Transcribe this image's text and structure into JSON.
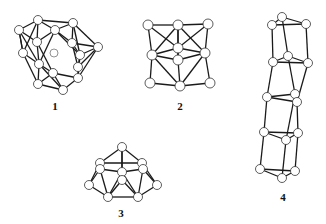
{
  "figure": {
    "background": "#ffffff",
    "line_color": "#1a1a1a",
    "atom_fill": "#ffffff",
    "atom_stroke": "#333333"
  },
  "structures": [
    {
      "id": "1",
      "label": "1",
      "label_pos": [
        55,
        106
      ],
      "atom_r": 4.5,
      "atoms": [
        [
          38,
          20
        ],
        [
          73,
          23
        ],
        [
          55,
          30
        ],
        [
          19,
          30
        ],
        [
          37,
          42
        ],
        [
          72,
          43
        ],
        [
          98,
          47
        ],
        [
          23,
          53
        ],
        [
          80,
          55
        ],
        [
          39,
          64
        ],
        [
          78,
          67
        ],
        [
          53,
          73
        ],
        [
          78,
          78
        ],
        [
          38,
          84
        ],
        [
          63,
          90
        ]
      ],
      "inner_atom": [
        54,
        53
      ],
      "bonds": [
        [
          0,
          1
        ],
        [
          0,
          2
        ],
        [
          0,
          3
        ],
        [
          1,
          2
        ],
        [
          1,
          6
        ],
        [
          1,
          5
        ],
        [
          2,
          4
        ],
        [
          2,
          5
        ],
        [
          3,
          4
        ],
        [
          3,
          7
        ],
        [
          0,
          4
        ],
        [
          4,
          9
        ],
        [
          7,
          9
        ],
        [
          7,
          3
        ],
        [
          5,
          6
        ],
        [
          5,
          8
        ],
        [
          6,
          8
        ],
        [
          6,
          10
        ],
        [
          8,
          10
        ],
        [
          8,
          12
        ],
        [
          10,
          12
        ],
        [
          9,
          11
        ],
        [
          11,
          12
        ],
        [
          11,
          14
        ],
        [
          12,
          14
        ],
        [
          9,
          13
        ],
        [
          13,
          14
        ],
        [
          13,
          7
        ],
        [
          2,
          9
        ],
        [
          4,
          11
        ],
        [
          5,
          10
        ],
        [
          2,
          8
        ],
        [
          11,
          13
        ],
        [
          3,
          9
        ],
        [
          1,
          8
        ],
        [
          0,
          7
        ],
        [
          12,
          6
        ],
        [
          9,
          14
        ]
      ]
    },
    {
      "id": "2",
      "label": "2",
      "label_pos": [
        180,
        106
      ],
      "atom_r": 5,
      "atoms": [
        [
          148,
          25
        ],
        [
          178,
          25
        ],
        [
          208,
          24
        ],
        [
          178,
          48
        ],
        [
          152,
          55
        ],
        [
          178,
          60
        ],
        [
          205,
          53
        ],
        [
          150,
          83
        ],
        [
          180,
          86
        ],
        [
          210,
          83
        ]
      ],
      "bonds": [
        [
          0,
          1
        ],
        [
          1,
          2
        ],
        [
          0,
          4
        ],
        [
          2,
          6
        ],
        [
          4,
          7
        ],
        [
          6,
          9
        ],
        [
          1,
          4
        ],
        [
          1,
          6
        ],
        [
          1,
          5
        ],
        [
          4,
          5
        ],
        [
          5,
          6
        ],
        [
          4,
          8
        ],
        [
          6,
          8
        ],
        [
          5,
          8
        ],
        [
          7,
          8
        ],
        [
          8,
          9
        ],
        [
          1,
          3
        ],
        [
          3,
          5
        ],
        [
          3,
          4
        ],
        [
          3,
          6
        ],
        [
          0,
          3
        ],
        [
          2,
          3
        ]
      ]
    },
    {
      "id": "3",
      "label": "3",
      "label_pos": [
        121,
        213
      ],
      "atom_r": 4.5,
      "atoms": [
        [
          122,
          147
        ],
        [
          100,
          163
        ],
        [
          142,
          163
        ],
        [
          100,
          169
        ],
        [
          143,
          169
        ],
        [
          122,
          172
        ],
        [
          89,
          185
        ],
        [
          157,
          185
        ],
        [
          122,
          180
        ],
        [
          108,
          197
        ],
        [
          138,
          197
        ]
      ],
      "bonds": [
        [
          0,
          1
        ],
        [
          0,
          2
        ],
        [
          0,
          5
        ],
        [
          1,
          3
        ],
        [
          2,
          4
        ],
        [
          1,
          2
        ],
        [
          3,
          5
        ],
        [
          4,
          5
        ],
        [
          3,
          6
        ],
        [
          4,
          7
        ],
        [
          6,
          9
        ],
        [
          7,
          10
        ],
        [
          9,
          10
        ],
        [
          5,
          9
        ],
        [
          5,
          10
        ],
        [
          8,
          9
        ],
        [
          8,
          10
        ],
        [
          3,
          9
        ],
        [
          4,
          10
        ],
        [
          1,
          6
        ],
        [
          2,
          7
        ],
        [
          0,
          8
        ],
        [
          5,
          8
        ]
      ]
    },
    {
      "id": "4",
      "label": "4",
      "label_pos": [
        283,
        197
      ],
      "atom_r": 4.5,
      "atoms": [
        [
          282,
          17
        ],
        [
          272,
          25
        ],
        [
          306,
          24
        ],
        [
          288,
          56
        ],
        [
          273,
          62
        ],
        [
          308,
          63
        ],
        [
          267,
          97
        ],
        [
          295,
          94
        ],
        [
          297,
          102
        ],
        [
          264,
          132
        ],
        [
          298,
          133
        ],
        [
          286,
          140
        ],
        [
          260,
          169
        ],
        [
          295,
          171
        ],
        [
          282,
          178
        ]
      ],
      "bonds": [
        [
          0,
          1
        ],
        [
          0,
          2
        ],
        [
          1,
          2
        ],
        [
          1,
          4
        ],
        [
          2,
          5
        ],
        [
          0,
          3
        ],
        [
          3,
          4
        ],
        [
          3,
          5
        ],
        [
          4,
          5
        ],
        [
          4,
          6
        ],
        [
          5,
          8
        ],
        [
          3,
          7
        ],
        [
          6,
          7
        ],
        [
          6,
          8
        ],
        [
          7,
          8
        ],
        [
          6,
          9
        ],
        [
          8,
          10
        ],
        [
          7,
          11
        ],
        [
          9,
          11
        ],
        [
          10,
          11
        ],
        [
          9,
          10
        ],
        [
          9,
          12
        ],
        [
          10,
          13
        ],
        [
          11,
          14
        ],
        [
          12,
          14
        ],
        [
          13,
          14
        ],
        [
          12,
          13
        ]
      ]
    }
  ]
}
